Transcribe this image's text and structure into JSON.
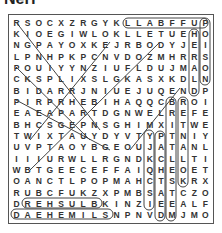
{
  "title": "Nerf",
  "grid": [
    "RSOCXZRGYKLLABFFUP",
    "KIOEGIWLOKLLETUEHO",
    "NGPAYOXKEJRBODYJEI",
    "LPNHPKPCNVDOZMHRRS",
    "POUIYYNZIUFLDUJMAO",
    "CKSPLIXSLGKASXKDLN",
    "BIDARRJNIUEJUQENDP",
    "PIRPRHEBIHAQQCBROI",
    "EAEAPARTDGNWELREFE",
    "BHCSGEPNSGHIMXITWE",
    "TWIXTAUYDYVTYPTNIY",
    "UVPTAOYBGEOUJATANL",
    "IIIURWLLRGNDKCLLTI",
    "WBTGEECEFFAIQHEOET",
    "OANCTLPOPMAHCTSKRX",
    "RUBCFUKZXPMBSATCZO",
    "DREHSULBKINZIEEALF",
    "DAEHEMILSNPNVDMJMO"
  ],
  "found_words": [
    {
      "word": "LLABFFU",
      "direction": "horizontal"
    },
    {
      "word": "POISON",
      "direction": "vertical"
    },
    {
      "word": "HERALD",
      "direction": "vertical"
    },
    {
      "word": "REHSULB",
      "direction": "horizontal"
    },
    {
      "word": "DAEHEMILS",
      "direction": "horizontal"
    }
  ]
}
